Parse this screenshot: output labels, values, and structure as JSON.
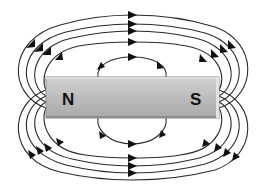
{
  "diagram": {
    "magnet": {
      "north_label": "N",
      "south_label": "S",
      "fill_color": "#b8b8b8",
      "edge_color": "#8a8a8a",
      "highlight_color": "#d6d6d6"
    },
    "field_lines": {
      "count_above": 5,
      "count_below": 5,
      "direction": "from N to S (arrows point right along center, curving back toward S)",
      "line_color": "#2a2a2a",
      "arrow_color": "#111111"
    }
  }
}
